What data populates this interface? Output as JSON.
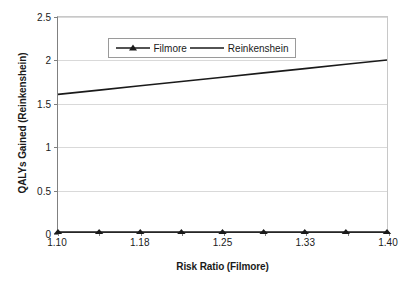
{
  "chart_data": {
    "type": "line",
    "title": "",
    "xlabel": "Risk Ratio (Filmore)",
    "ylabel": "QALYs Gained (Reinkenshein)",
    "xlim": [
      1.1,
      1.4
    ],
    "ylim": [
      0,
      2.5
    ],
    "grid": true,
    "legend_position": "top-left-inside",
    "x": [
      1.1,
      1.1375,
      1.175,
      1.2125,
      1.25,
      1.2875,
      1.325,
      1.3625,
      1.4
    ],
    "x_tick_labels": [
      "1.10",
      "",
      "1.18",
      "",
      "1.25",
      "",
      "1.33",
      "",
      "1.40"
    ],
    "x_tick_labels_shown": [
      "1.10",
      "1.18",
      "1.25",
      "1.33",
      "1.40"
    ],
    "y_tick_labels": [
      "0",
      "0.5",
      "1",
      "1.5",
      "2",
      "2.5"
    ],
    "y_ticks": [
      0,
      0.5,
      1,
      1.5,
      2,
      2.5
    ],
    "series": [
      {
        "name": "Filmore",
        "marker": "triangle",
        "color": "#1a1a1a",
        "values": [
          0,
          0,
          0,
          0,
          0,
          0,
          0,
          0,
          0
        ]
      },
      {
        "name": "Reinkenshein",
        "marker": "none",
        "color": "#1a1a1a",
        "values": [
          1.6,
          1.65,
          1.7,
          1.75,
          1.8,
          1.85,
          1.9,
          1.95,
          2.0
        ]
      }
    ]
  },
  "legend": {
    "entries": [
      {
        "label": "Filmore"
      },
      {
        "label": "Reinkenshein"
      }
    ]
  },
  "axes": {
    "x_title": "Risk Ratio (Filmore)",
    "y_title": "QALYs Gained (Reinkenshein)"
  },
  "colors": {
    "series": "#1a1a1a",
    "gridline": "#d9d9d9",
    "axis": "#808080",
    "background": "#ffffff"
  }
}
